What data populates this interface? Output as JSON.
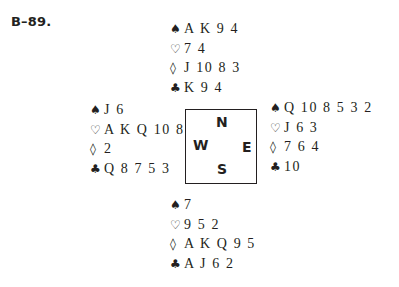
{
  "problem_label": "B–89.",
  "suit_symbols": {
    "spades": "♠",
    "hearts": "♡",
    "diamonds": "◊",
    "clubs": "♣"
  },
  "hands": {
    "north": {
      "spades": "A K 9 4",
      "hearts": "7 4",
      "diamonds": "J 10 8 3",
      "clubs": "K 9 4"
    },
    "west": {
      "spades": "J 6",
      "hearts": "A K Q 10 8",
      "diamonds": "2",
      "clubs": "Q 8 7 5 3"
    },
    "east": {
      "spades": "Q 10 8 5 3 2",
      "hearts": "J 6 3",
      "diamonds": "7 6 4",
      "clubs": "10"
    },
    "south": {
      "spades": "7",
      "hearts": "9 5 2",
      "diamonds": "A K Q 9 5",
      "clubs": "A J 6 2"
    }
  },
  "compass": {
    "north": "N",
    "west": "W",
    "east": "E",
    "south": "S"
  }
}
